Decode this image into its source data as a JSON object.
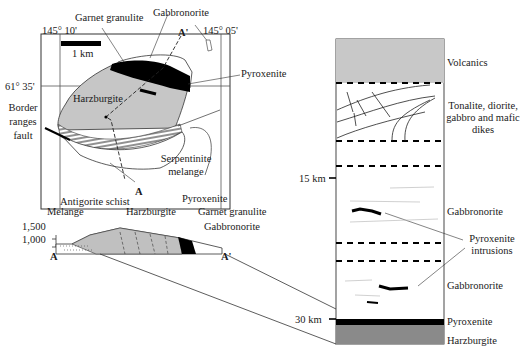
{
  "map": {
    "lon_left": "145° 10'",
    "lon_right": "145° 05'",
    "lat": "61° 35'",
    "scale": "1 km",
    "section_start": "A",
    "section_end": "A'",
    "labels": {
      "garnet_granulite": "Garnet granulite",
      "gabbronorite": "Gabbronorite",
      "pyroxenite": "Pyroxenite",
      "harzburgite": "Harzburgite",
      "border_fault_1": "Border",
      "border_fault_2": "ranges",
      "border_fault_3": "fault",
      "serpentinite_1": "Serpentinite",
      "serpentinite_2": "melange"
    }
  },
  "cross_section": {
    "elev_1500": "1,500",
    "elev_1000": "1,000",
    "start": "A",
    "end": "A'",
    "labels": {
      "antigorite": "Antigorite schist",
      "melange": "Melange",
      "harzburgite": "Harzburgite",
      "pyroxenite": "Pyroxenite",
      "garnet_granulite": "Garnet granulite",
      "gabbronorite": "Gabbronorite"
    }
  },
  "column": {
    "depth_15": "15 km",
    "depth_30": "30 km",
    "units": {
      "volcanics": "Volcanics",
      "dikes_1": "Tonalite, diorite,",
      "dikes_2": "gabbro and mafic",
      "dikes_3": "dikes",
      "gabbronorite_upper": "Gabbronorite",
      "intrusions_1": "Pyroxenite",
      "intrusions_2": "intrusions",
      "gabbronorite_lower": "Gabbronorite",
      "pyroxenite": "Pyroxenite",
      "harzburgite": "Harzburgite"
    }
  }
}
